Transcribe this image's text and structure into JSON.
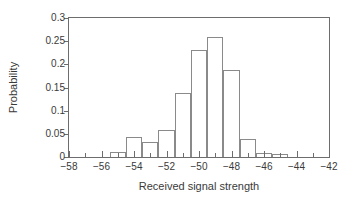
{
  "chart_data": {
    "type": "bar",
    "title": "",
    "xlabel": "Received signal strength",
    "ylabel": "Probability",
    "xlim": [
      -58,
      -42
    ],
    "ylim": [
      0,
      0.3
    ],
    "grid": false,
    "legend": null,
    "bin_width": 1,
    "x_ticks": [
      -58,
      -56,
      -54,
      -52,
      -50,
      -48,
      -46,
      -44,
      -42
    ],
    "x_tick_labels": [
      "−58",
      "−56",
      "−54",
      "−52",
      "−50",
      "−48",
      "−46",
      "−44",
      "−42"
    ],
    "x_minor_ticks": [
      -57,
      -55,
      -53,
      -51,
      -49,
      -47,
      -45,
      -43
    ],
    "y_ticks": [
      0,
      0.05,
      0.1,
      0.15,
      0.2,
      0.25,
      0.3
    ],
    "y_tick_labels": [
      "0",
      "0.05",
      "0.1",
      "0.15",
      "0.2",
      "0.25",
      "0.3"
    ],
    "categories": [
      -55,
      -54,
      -53,
      -52,
      -51,
      -50,
      -49,
      -48,
      -47,
      -46,
      -45
    ],
    "bin_edges": [
      -55.5,
      -54.5,
      -53.5,
      -52.5,
      -51.5,
      -50.5,
      -49.5,
      -48.5,
      -47.5,
      -46.5,
      -45.5,
      -44.5
    ],
    "values": [
      0.01,
      0.044,
      0.032,
      0.059,
      0.139,
      0.232,
      0.258,
      0.188,
      0.038,
      0.008,
      0.007
    ],
    "bars": [
      {
        "center": -55,
        "left": -55.5,
        "right": -54.5,
        "value": 0.01
      },
      {
        "center": -54,
        "left": -54.5,
        "right": -53.5,
        "value": 0.044
      },
      {
        "center": -53,
        "left": -53.5,
        "right": -52.5,
        "value": 0.032
      },
      {
        "center": -52,
        "left": -52.5,
        "right": -51.5,
        "value": 0.059
      },
      {
        "center": -51,
        "left": -51.5,
        "right": -50.5,
        "value": 0.139
      },
      {
        "center": -50,
        "left": -50.5,
        "right": -49.5,
        "value": 0.232
      },
      {
        "center": -49,
        "left": -49.5,
        "right": -48.5,
        "value": 0.258
      },
      {
        "center": -48,
        "left": -48.5,
        "right": -47.5,
        "value": 0.188
      },
      {
        "center": -47,
        "left": -47.5,
        "right": -46.5,
        "value": 0.038
      },
      {
        "center": -46,
        "left": -46.5,
        "right": -45.5,
        "value": 0.008
      },
      {
        "center": -45,
        "left": -45.5,
        "right": -44.5,
        "value": 0.007
      }
    ],
    "colors": {
      "bar_edge": "#8a8a8a",
      "bar_fill": "transparent",
      "axis": "#6d6d6d",
      "text": "#3a3a3a",
      "background": "#ffffff"
    }
  }
}
